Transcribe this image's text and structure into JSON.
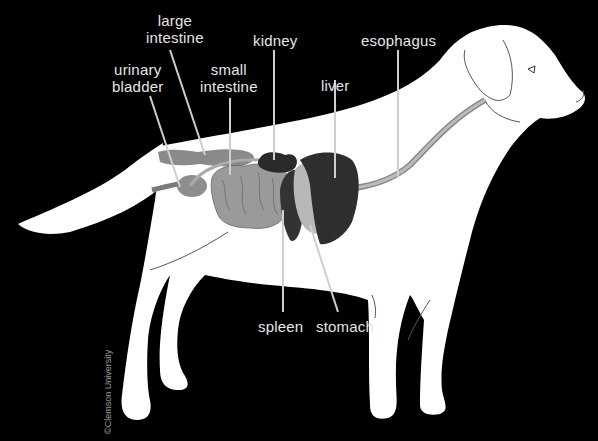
{
  "diagram": {
    "background_color": "#000000",
    "body_color": "#ffffff",
    "label_color": "#e6e6e6",
    "labels": {
      "large_intestine": "large\nintestine",
      "kidney": "kidney",
      "esophagus": "esophagus",
      "urinary_bladder": "urinary\nbladder",
      "small_intestine": "small\nintestine",
      "liver": "liver",
      "spleen": "spleen",
      "stomach": "stomach"
    },
    "credit": "©Clemson University"
  }
}
